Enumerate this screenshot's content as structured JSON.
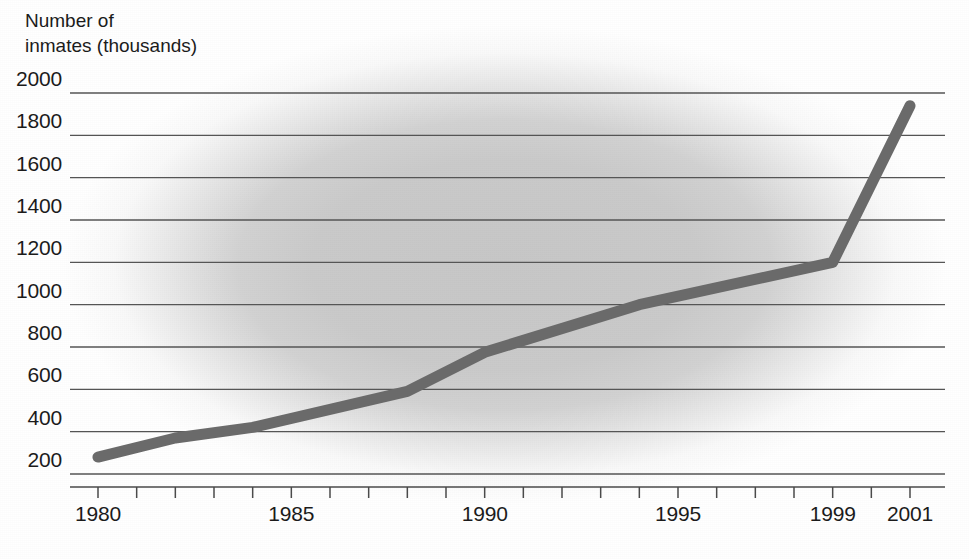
{
  "chart_data": {
    "type": "line",
    "title": "Number of\ninmates (thousands)",
    "ylabel": "Number of inmates (thousands)",
    "xlabel": "",
    "grid": "horizontal",
    "legend": "none",
    "xlim": [
      1980,
      2001
    ],
    "ylim": [
      200,
      2000
    ],
    "ytick_labels": [
      "2000",
      "1800",
      "1600",
      "1400",
      "1200",
      "1000",
      "800",
      "600",
      "400",
      "200"
    ],
    "yticks": [
      2000,
      1800,
      1600,
      1400,
      1200,
      1000,
      800,
      600,
      400,
      200
    ],
    "xtick_labels": [
      "1980",
      "1985",
      "1990",
      "1995",
      "1999",
      "2001"
    ],
    "xticks": [
      1980,
      1985,
      1990,
      1995,
      1999,
      2001
    ],
    "x_minor_ticks": [
      1980,
      1981,
      1982,
      1983,
      1984,
      1985,
      1986,
      1987,
      1988,
      1989,
      1990,
      1991,
      1992,
      1993,
      1994,
      1995,
      1996,
      1997,
      1998,
      1999,
      2000,
      2001
    ],
    "series": [
      {
        "name": "Number of inmates",
        "x": [
          1980,
          1982,
          1984,
          1988,
          1990,
          1994,
          1999,
          2001
        ],
        "values": [
          280,
          370,
          420,
          590,
          775,
          1000,
          1200,
          1940
        ]
      }
    ],
    "colors": {
      "line": "#6a6a6a",
      "grid": "#555555",
      "axis": "#4a4a4a",
      "text": "#1b1b1b",
      "plot_background": "#c8c8c8",
      "page_background": "#ffffff"
    }
  }
}
